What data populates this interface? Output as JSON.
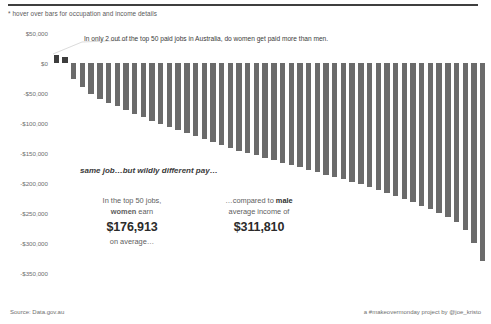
{
  "header": {
    "hover_hint": "* hover over bars for occupation and income details",
    "ghost_title_fragment": ""
  },
  "annotations": {
    "top_callout": "In only 2 out of the top 50 paid jobs in Australia, do women get paid more than men.",
    "mid_callout": "same job…but wildly different pay…",
    "women": {
      "line1_a": "In the top 50 jobs,",
      "line2_bold": "women",
      "line2_rest": " earn",
      "value": "$176,913",
      "line4": "on average…"
    },
    "men": {
      "line1_a": "…compared to ",
      "line1_bold": "male",
      "line2": "average income of",
      "value": "$311,810"
    }
  },
  "footer": {
    "source": "Source: Data.gov.au",
    "credit": "a #makeovermonday project by @joe_kristo"
  },
  "colors": {
    "bar_negative": "#6b6b6b",
    "bar_positive": "#3d3d3d",
    "text_muted": "#6f6f6f",
    "rule": "#3f3f3f"
  },
  "chart_data": {
    "type": "bar",
    "title": "",
    "xlabel": "",
    "ylabel": "",
    "ylim": [
      -375000,
      62000
    ],
    "grid": false,
    "legend_position": "none",
    "ytick_labels": [
      "$50,000",
      "$0",
      "-$50,000",
      "-$100,000",
      "-$150,000",
      "-$200,000",
      "-$250,000",
      "-$300,000",
      "-$350,000"
    ],
    "ytick_values": [
      50000,
      0,
      -50000,
      -100000,
      -150000,
      -200000,
      -250000,
      -300000,
      -350000
    ],
    "categories": [
      "Job 1",
      "Job 2",
      "Job 3",
      "Job 4",
      "Job 5",
      "Job 6",
      "Job 7",
      "Job 8",
      "Job 9",
      "Job 10",
      "Job 11",
      "Job 12",
      "Job 13",
      "Job 14",
      "Job 15",
      "Job 16",
      "Job 17",
      "Job 18",
      "Job 19",
      "Job 20",
      "Job 21",
      "Job 22",
      "Job 23",
      "Job 24",
      "Job 25",
      "Job 26",
      "Job 27",
      "Job 28",
      "Job 29",
      "Job 30",
      "Job 31",
      "Job 32",
      "Job 33",
      "Job 34",
      "Job 35",
      "Job 36",
      "Job 37",
      "Job 38",
      "Job 39",
      "Job 40",
      "Job 41",
      "Job 42",
      "Job 43",
      "Job 44",
      "Job 45",
      "Job 46",
      "Job 47",
      "Job 48",
      "Job 49",
      "Job 50"
    ],
    "values": [
      14000,
      11000,
      -26000,
      -40000,
      -52000,
      -60000,
      -66000,
      -72000,
      -78000,
      -84000,
      -90000,
      -96000,
      -101000,
      -106000,
      -111000,
      -116000,
      -121000,
      -126000,
      -131000,
      -136000,
      -141000,
      -146000,
      -150000,
      -154000,
      -158000,
      -162000,
      -166000,
      -170000,
      -174000,
      -178000,
      -182000,
      -186000,
      -190000,
      -194000,
      -198000,
      -202000,
      -207000,
      -212000,
      -217000,
      -222000,
      -227000,
      -232000,
      -238000,
      -244000,
      -250000,
      -257000,
      -265000,
      -278000,
      -300000,
      -330000
    ],
    "series_name": "Gender pay gap (women minus men)",
    "n_bars": 50
  }
}
